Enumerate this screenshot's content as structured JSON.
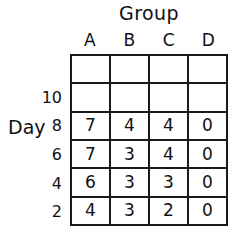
{
  "figure": {
    "column_axis_title": "Group",
    "row_axis_title": "Day",
    "column_headers": [
      "A",
      "B",
      "C",
      "D"
    ],
    "row_labels": [
      "",
      "10",
      "8",
      "6",
      "4",
      "2"
    ],
    "ink_color": "#1a1a1a",
    "background_color": "#ffffff"
  },
  "chart_data": {
    "type": "table",
    "title": "Group",
    "xlabel": "Group",
    "ylabel": "Day",
    "categories": [
      "A",
      "B",
      "C",
      "D"
    ],
    "row_labels": [
      "",
      "10",
      "8",
      "6",
      "4",
      "2"
    ],
    "rows": [
      {
        "label": "",
        "values": [
          "",
          "",
          "",
          ""
        ]
      },
      {
        "label": "10",
        "values": [
          "",
          "",
          "",
          ""
        ]
      },
      {
        "label": "8",
        "values": [
          "7",
          "4",
          "4",
          "0"
        ]
      },
      {
        "label": "6",
        "values": [
          "7",
          "3",
          "4",
          "0"
        ]
      },
      {
        "label": "4",
        "values": [
          "6",
          "3",
          "3",
          "0"
        ]
      },
      {
        "label": "2",
        "values": [
          "4",
          "3",
          "2",
          "0"
        ]
      }
    ],
    "grid": true,
    "legend": "none"
  }
}
